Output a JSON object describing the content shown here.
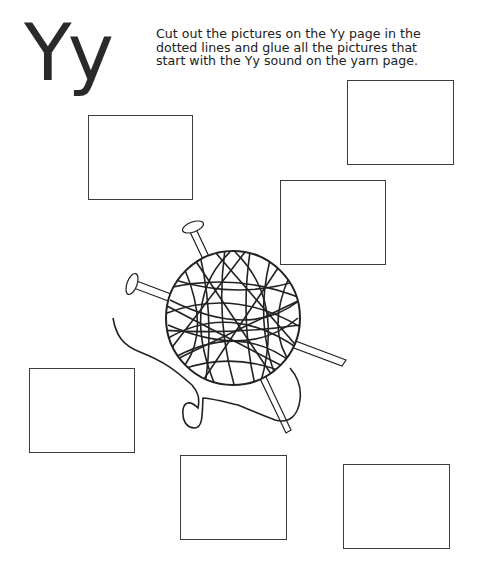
{
  "worksheet": {
    "letter_heading": "Yy",
    "instructions": [
      "Cut out the pictures on the Yy page in the",
      "dotted lines and glue all the pictures that",
      "start with the Yy sound on the yarn page."
    ],
    "illustration": "yarn-ball-with-knitting-needles",
    "glue_boxes": [
      {
        "id": "box-1",
        "x": 88,
        "y": 115,
        "w": 105,
        "h": 85
      },
      {
        "id": "box-2",
        "x": 347,
        "y": 80,
        "w": 107,
        "h": 85
      },
      {
        "id": "box-3",
        "x": 280,
        "y": 180,
        "w": 106,
        "h": 85
      },
      {
        "id": "box-4",
        "x": 29,
        "y": 368,
        "w": 106,
        "h": 85
      },
      {
        "id": "box-5",
        "x": 180,
        "y": 455,
        "w": 107,
        "h": 85
      },
      {
        "id": "box-6",
        "x": 343,
        "y": 464,
        "w": 107,
        "h": 85
      }
    ],
    "colors": {
      "ink": "#222222",
      "paper": "#ffffff"
    }
  }
}
